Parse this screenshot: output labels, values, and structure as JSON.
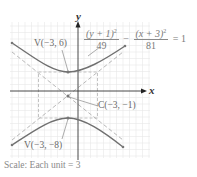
{
  "figure": {
    "axes": {
      "x_label": "x",
      "y_label": "y"
    },
    "equation": {
      "term1_num": "(y + 1)",
      "term1_exp": "2",
      "term1_den": "49",
      "operator": "−",
      "term2_num": "(x + 3)",
      "term2_exp": "2",
      "term2_den": "81",
      "rhs": "= 1"
    },
    "labels": {
      "upper_vertex": "V(−3, 6)",
      "center": "C(−3, −1)",
      "lower_vertex": "V(−3, −8)"
    },
    "caption": "Scale: Each unit = 3",
    "colors": {
      "curve": "#6e6e6e",
      "asymptote": "#b0b0b0",
      "grid": "#e6e6e6",
      "axis": "#333333"
    }
  }
}
